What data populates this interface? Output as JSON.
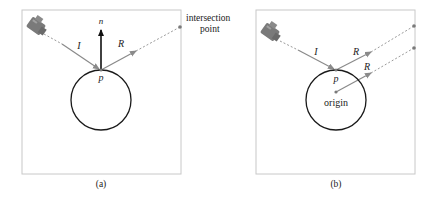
{
  "panels": [
    {
      "id": "a",
      "caption": "(a)",
      "labels": {
        "incident": "I",
        "reflected": "R",
        "normal": "n",
        "point": "p",
        "intersection_line1": "intersection",
        "intersection_line2": "point"
      }
    },
    {
      "id": "b",
      "caption": "(b)",
      "labels": {
        "incident": "I",
        "reflected_1": "R",
        "reflected_2": "R",
        "point": "p",
        "origin": "origin"
      }
    }
  ],
  "colors": {
    "frame": "#c8c8c8",
    "circle": "#1a1a1a",
    "ray": "#8a8a8a",
    "dashed": "#9a9a9a",
    "normal": "#111111",
    "camera": "#7a7a7a",
    "dot": "#7a7a7a"
  },
  "icons": {
    "camera": "camera-icon"
  }
}
